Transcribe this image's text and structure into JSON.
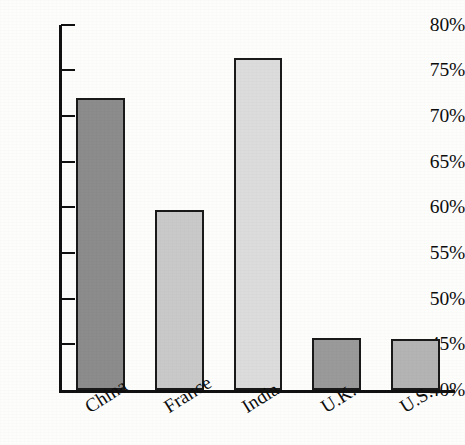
{
  "chart_data": {
    "type": "bar",
    "title": "",
    "subtitle": "",
    "xlabel": "",
    "ylabel": "",
    "categories": [
      "China",
      "France",
      "India",
      "U.K.",
      "U.S."
    ],
    "values": [
      72.0,
      59.7,
      76.3,
      45.7,
      45.6
    ],
    "value_labels": [
      "72.0%",
      "59.7%",
      "76.3%",
      "45.7%",
      "45.6%"
    ],
    "bar_colors": [
      "#8c8c8c",
      "#c9c9c9",
      "#dcdcdc",
      "#9a9a9a",
      "#b4b4b4"
    ],
    "bar_border_color": "#1a1a1a",
    "ylim": [
      40,
      80
    ],
    "ytick_values": [
      40,
      45,
      50,
      55,
      60,
      65,
      70,
      75,
      80
    ],
    "ytick_labels": [
      "40%",
      "45%",
      "50%",
      "55%",
      "60%",
      "65%",
      "70%",
      "75%",
      "80%"
    ],
    "grid": false,
    "legend": null,
    "legend_position": "none",
    "axis_color": "#111111",
    "background_color": "#fdfdfc",
    "text_color": "#0d0d0d"
  }
}
